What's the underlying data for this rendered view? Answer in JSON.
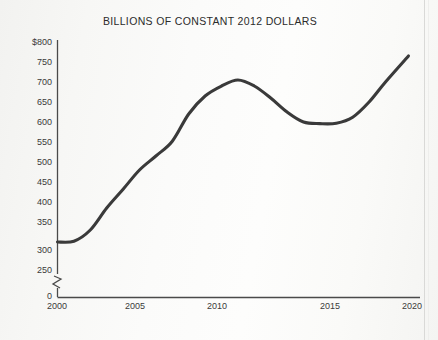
{
  "chart_data": {
    "type": "line",
    "title": "BILLIONS OF CONSTANT 2012 DOLLARS",
    "xlabel": "",
    "ylabel": "",
    "grid": false,
    "legend": "none",
    "axis_break": {
      "present": true,
      "axis": "y",
      "between": [
        0,
        250
      ],
      "symbol": "zigzag"
    },
    "xlim": [
      2000,
      2021.5
    ],
    "ylim": [
      250,
      800
    ],
    "y_axis_origin_label": "0",
    "ytick_labels": [
      "$800",
      "750",
      "700",
      "650",
      "600",
      "550",
      "500",
      "450",
      "400",
      "350",
      "300",
      "250",
      "0"
    ],
    "ytick_values": [
      800,
      750,
      700,
      650,
      600,
      550,
      500,
      450,
      400,
      350,
      300,
      250,
      0
    ],
    "xtick_labels": [
      "2000",
      "2005",
      "2010",
      "2015",
      "2020"
    ],
    "xtick_values": [
      2000,
      2005,
      2010,
      2015,
      2020
    ],
    "series": [
      {
        "name": "Spending",
        "color": "#3a3a3a",
        "x": [
          2000,
          2001,
          2002,
          2003,
          2004,
          2005,
          2006,
          2007,
          2008,
          2009,
          2010,
          2011,
          2012,
          2013,
          2014,
          2015,
          2016,
          2017,
          2018,
          2019,
          2020,
          2021.4
        ],
        "values": [
          300,
          302,
          330,
          385,
          432,
          480,
          515,
          552,
          620,
          665,
          690,
          705,
          690,
          660,
          625,
          600,
          596,
          597,
          612,
          650,
          700,
          765
        ]
      }
    ]
  },
  "axis": {
    "ytick_label_0": "$800",
    "ytick_label_1": "750",
    "ytick_label_2": "700",
    "ytick_label_3": "650",
    "ytick_label_4": "600",
    "ytick_label_5": "550",
    "ytick_label_6": "500",
    "ytick_label_7": "450",
    "ytick_label_8": "400",
    "ytick_label_9": "350",
    "ytick_label_10": "300",
    "ytick_label_11": "250",
    "zero_label": "0",
    "xtick_label_0": "2000",
    "xtick_label_1": "2005",
    "xtick_label_2": "2010",
    "xtick_label_3": "2015",
    "xtick_label_4": "2020"
  }
}
